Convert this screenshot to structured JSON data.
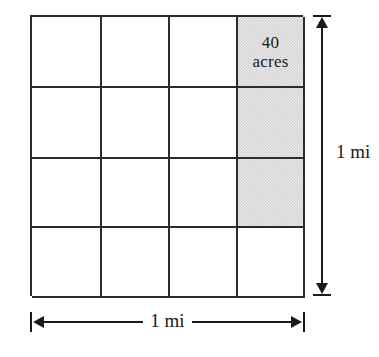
{
  "figure": {
    "background_color": "#ffffff",
    "line_color": "#2b2b2b",
    "shade_color": "#d4d4d4"
  },
  "grid": {
    "rows": 4,
    "columns": 4,
    "cells": [
      {
        "row": 1,
        "col": 1,
        "shaded": false,
        "label": ""
      },
      {
        "row": 1,
        "col": 2,
        "shaded": false,
        "label": ""
      },
      {
        "row": 1,
        "col": 3,
        "shaded": false,
        "label": ""
      },
      {
        "row": 1,
        "col": 4,
        "shaded": true,
        "label": "40\nacres"
      },
      {
        "row": 2,
        "col": 1,
        "shaded": false,
        "label": ""
      },
      {
        "row": 2,
        "col": 2,
        "shaded": false,
        "label": ""
      },
      {
        "row": 2,
        "col": 3,
        "shaded": false,
        "label": ""
      },
      {
        "row": 2,
        "col": 4,
        "shaded": true,
        "label": ""
      },
      {
        "row": 3,
        "col": 1,
        "shaded": false,
        "label": ""
      },
      {
        "row": 3,
        "col": 2,
        "shaded": false,
        "label": ""
      },
      {
        "row": 3,
        "col": 3,
        "shaded": false,
        "label": ""
      },
      {
        "row": 3,
        "col": 4,
        "shaded": true,
        "label": ""
      },
      {
        "row": 4,
        "col": 1,
        "shaded": false,
        "label": ""
      },
      {
        "row": 4,
        "col": 2,
        "shaded": false,
        "label": ""
      },
      {
        "row": 4,
        "col": 3,
        "shaded": false,
        "label": ""
      },
      {
        "row": 4,
        "col": 4,
        "shaded": false,
        "label": ""
      }
    ]
  },
  "dimensions": {
    "vertical": {
      "label": "1 mi",
      "orientation": "vertical"
    },
    "horizontal": {
      "label": "1 mi",
      "orientation": "horizontal"
    }
  }
}
